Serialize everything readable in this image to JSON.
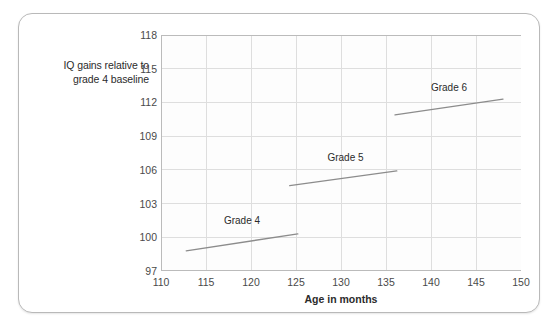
{
  "chart_data": {
    "type": "line",
    "title": "",
    "xlabel": "Age in months",
    "ylabel": "IQ gains relative to grade 4 baseline",
    "xlim": [
      110,
      150
    ],
    "ylim": [
      97,
      118
    ],
    "xticks": [
      110,
      115,
      120,
      125,
      130,
      135,
      140,
      145,
      150
    ],
    "yticks": [
      97,
      100,
      103,
      106,
      109,
      112,
      115,
      118
    ],
    "grid": true,
    "legend_position": "inline-annotation",
    "series": [
      {
        "name": "Grade 4",
        "label": "Grade 4",
        "label_x": 119.0,
        "label_y": 101.5,
        "x": [
          112.8,
          125.2
        ],
        "y": [
          98.8,
          100.3
        ]
      },
      {
        "name": "Grade 5",
        "label": "Grade 5",
        "label_x": 130.5,
        "label_y": 107.1,
        "x": [
          124.3,
          136.2
        ],
        "y": [
          104.6,
          105.9
        ]
      },
      {
        "name": "Grade 6",
        "label": "Grade 6",
        "label_x": 142.0,
        "label_y": 113.4,
        "x": [
          136.0,
          148.0
        ],
        "y": [
          110.9,
          112.3
        ]
      }
    ]
  },
  "colors": {
    "line": "#8c8c8c",
    "grid": "#dedede",
    "axis": "#bbbbbb",
    "text": "#2b2b2b",
    "tick_text": "#4a4a4a",
    "frame": "#b9b9b9",
    "plot_background": "#fdfdfd"
  },
  "axis": {
    "y_title_line1": "IQ gains relative to",
    "y_title_line2": "grade 4 baseline",
    "x_title": "Age in months"
  }
}
